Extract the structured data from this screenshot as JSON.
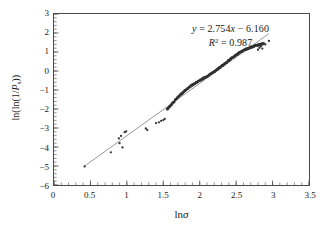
{
  "chart_data": {
    "type": "scatter",
    "title": "",
    "subtitle": "",
    "xlabel": "lnσ",
    "ylabel": "ln(ln(1/Pₛ))",
    "xlim": [
      0,
      3.5
    ],
    "ylim": [
      -6,
      3
    ],
    "grid": false,
    "legend": null,
    "x_ticks": [
      "0",
      "0.5",
      "1",
      "1.5",
      "2",
      "2.5",
      "3",
      "3.5"
    ],
    "x_tick_values": [
      0,
      0.5,
      1,
      1.5,
      2,
      2.5,
      3,
      3.5
    ],
    "x_minor_step": 0.1,
    "y_ticks": [
      "3",
      "2",
      "1",
      "0",
      "−1",
      "−2",
      "−3",
      "−4",
      "−5",
      "−6"
    ],
    "y_tick_values": [
      3,
      2,
      1,
      0,
      -1,
      -2,
      -3,
      -4,
      -5,
      -6
    ],
    "y_minor_step": 0.2,
    "marker_color": "#333333",
    "line_color": "#6b6b6b",
    "frame_color": "#4a4a4a",
    "annotation": {
      "equation_prefix": "y",
      "equation_body": " = 2.754",
      "equation_var": "x",
      "equation_tail": " − 6.160",
      "equation_full": "y = 2.754x − 6.160",
      "r2_symbol": "R",
      "r2_sup": "2",
      "r2_value": " = 0.987",
      "r2_full": "R² = 0.987",
      "slope": 2.754,
      "intercept": -6.16,
      "r_squared": 0.987
    },
    "fit_line": {
      "x_start": 0.42,
      "x_end": 2.95,
      "slope": 2.754,
      "intercept": -6.16
    },
    "series": [
      {
        "name": "sparse-points",
        "points": [
          [
            0.42,
            -5.02
          ],
          [
            0.78,
            -4.28
          ],
          [
            0.89,
            -3.55
          ],
          [
            0.9,
            -3.8
          ],
          [
            0.92,
            -3.42
          ],
          [
            0.94,
            -4.02
          ],
          [
            0.97,
            -3.22
          ],
          [
            0.99,
            -3.18
          ],
          [
            1.26,
            -3.02
          ],
          [
            1.28,
            -3.1
          ],
          [
            1.4,
            -2.74
          ],
          [
            1.44,
            -2.7
          ],
          [
            1.47,
            -2.62
          ],
          [
            1.5,
            -2.58
          ],
          [
            1.52,
            -2.52
          ]
        ]
      },
      {
        "name": "dense-band",
        "x_start": 1.55,
        "x_end": 2.88,
        "count": 420,
        "description": "dense near-continuous band of points rising from about -2.2 to 1.3"
      },
      {
        "name": "upper-outliers",
        "points": [
          [
            2.8,
            1.12
          ],
          [
            2.82,
            1.22
          ],
          [
            2.84,
            1.3
          ],
          [
            2.86,
            1.18
          ],
          [
            2.9,
            1.4
          ],
          [
            2.95,
            1.58
          ]
        ]
      }
    ]
  }
}
